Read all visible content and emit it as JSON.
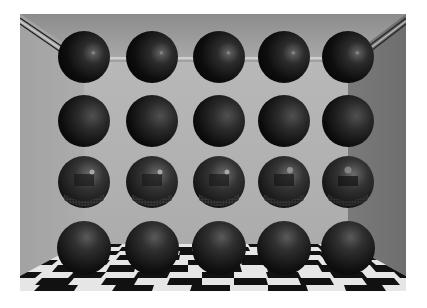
{
  "scene": {
    "description": "Rendered 3D room with a 4x5 grid of spheres and a checkered floor",
    "frame": {
      "x": 20,
      "y": 14,
      "width": 386,
      "height": 277
    },
    "colors": {
      "ceiling_top": "#8f8f8f",
      "ceiling_bottom": "#a6a6a6",
      "back_wall": "#b3b3b3",
      "left_wall": "#a8a8a8",
      "right_wall": "#7c7c7c",
      "molding_light": "#c9c9c9",
      "molding_dark": "#2a2a2a",
      "floor_light": "#e6e6e6",
      "floor_dark": "#111111",
      "sphere_base": "#0e0e0e"
    },
    "grid": {
      "rows": 4,
      "columns": 5
    },
    "rows": [
      {
        "label": "glossy-specular",
        "cy": 43,
        "spheres": [
          64,
          132,
          199,
          264,
          328
        ],
        "r": 26
      },
      {
        "label": "diffuse-shaded",
        "cy": 107,
        "spheres": [
          64,
          132,
          199,
          264,
          328
        ],
        "r": 26
      },
      {
        "label": "mirror-reflective",
        "cy": 168,
        "spheres": [
          64,
          132,
          199,
          264,
          328
        ],
        "r": 26
      },
      {
        "label": "floor-resting",
        "cy": 234,
        "spheres": [
          64,
          132,
          199,
          264,
          328
        ],
        "r": 27
      }
    ]
  }
}
